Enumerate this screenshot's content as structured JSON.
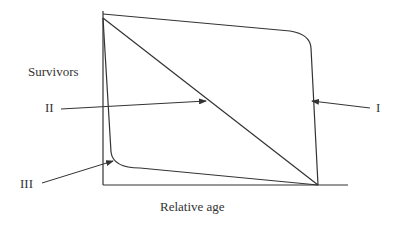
{
  "diagram": {
    "y_axis_label": "Survivors",
    "x_axis_label": "Relative age",
    "curves": [
      {
        "id": "I",
        "label": "I",
        "description": "Type I: high survival until late age, then steep drop"
      },
      {
        "id": "II",
        "label": "II",
        "description": "Type II: constant mortality (straight diagonal)"
      },
      {
        "id": "III",
        "label": "III",
        "description": "Type III: steep early drop, then low steady decline"
      }
    ],
    "colors": {
      "line": "#333333",
      "background": "#ffffff"
    }
  }
}
